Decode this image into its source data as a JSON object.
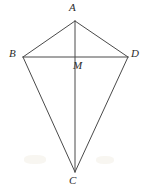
{
  "figure": {
    "kind": "geometry-diagram",
    "background_color": "#ffffff",
    "stroke_color": "#4a4a4a",
    "label_color": "#2b2b2b",
    "stroke_width": 1,
    "width": 146,
    "height": 189
  },
  "points": {
    "A": {
      "label": "A",
      "x": 75,
      "y": 21,
      "label_x": 69,
      "label_y": 2
    },
    "B": {
      "label": "B",
      "x": 23,
      "y": 57,
      "label_x": 9,
      "label_y": 48
    },
    "C": {
      "label": "C",
      "x": 75,
      "y": 172,
      "label_x": 69,
      "label_y": 175
    },
    "D": {
      "label": "D",
      "x": 128,
      "y": 57,
      "label_x": 131,
      "label_y": 48
    },
    "M": {
      "label": "M",
      "x": 75,
      "y": 57,
      "label_x": 73,
      "label_y": 60
    }
  },
  "segments": [
    {
      "name": "AB",
      "from": "A",
      "to": "B"
    },
    {
      "name": "AD",
      "from": "A",
      "to": "D"
    },
    {
      "name": "BC",
      "from": "B",
      "to": "C"
    },
    {
      "name": "DC",
      "from": "D",
      "to": "C"
    },
    {
      "name": "AC",
      "from": "A",
      "to": "C"
    },
    {
      "name": "BD",
      "from": "B",
      "to": "D"
    }
  ]
}
